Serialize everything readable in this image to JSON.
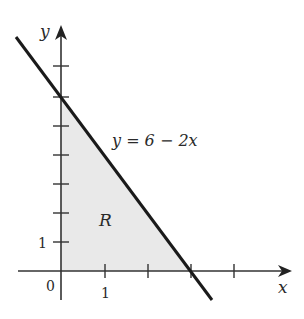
{
  "figure": {
    "axes": {
      "x_label": "x",
      "y_label": "y",
      "origin_label": "0",
      "x_tick_label": "1",
      "y_tick_label": "1"
    },
    "line_equation": "y = 6 − 2x",
    "region_label": "R",
    "colors": {
      "line": "#1a1a1a",
      "axis": "#333333",
      "region_fill": "#e9e9e9"
    }
  },
  "diagram_data": {
    "type": "region-plot",
    "line": {
      "equation": "y = 6 - 2x",
      "x_intercept": 3,
      "y_intercept": 6
    },
    "region": {
      "name": "R",
      "vertices": [
        [
          0,
          0
        ],
        [
          3,
          0
        ],
        [
          0,
          6
        ]
      ]
    },
    "x_ticks": [
      1,
      2,
      3,
      4
    ],
    "y_ticks": [
      1,
      2,
      3,
      4,
      5,
      6,
      7
    ]
  }
}
